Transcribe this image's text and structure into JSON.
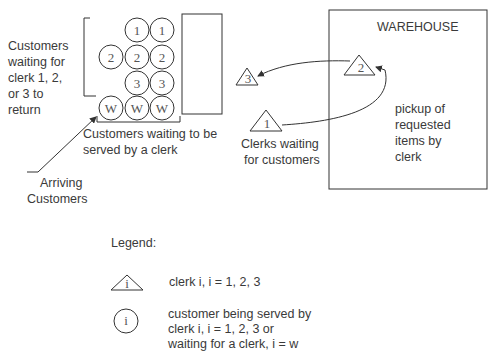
{
  "diagram": {
    "left_label": [
      "Customers",
      "waiting for",
      "clerk 1, 2,",
      "or 3 to",
      "return"
    ],
    "queue_label": [
      "Customers waiting to be",
      "served by a clerk"
    ],
    "arriving_label": [
      "Arriving",
      "Customers"
    ],
    "clerks_waiting_label": [
      "Clerks waiting",
      "for customers"
    ],
    "warehouse_title": "WAREHOUSE",
    "pickup_label": [
      "pickup of",
      "requested",
      "items by",
      "clerk"
    ],
    "circles": {
      "row1": [
        "1",
        "1"
      ],
      "row2": [
        "2",
        "2",
        "2"
      ],
      "row3": [
        "3",
        "3"
      ],
      "row4": [
        "W",
        "W",
        "W"
      ]
    },
    "triangles": {
      "t3": "3",
      "t1": "1",
      "t2": "2"
    }
  },
  "legend": {
    "title": "Legend:",
    "triangle_symbol": "i",
    "triangle_text": "clerk i, i = 1, 2, 3",
    "circle_symbol": "i",
    "circle_text": [
      "customer being served by",
      "clerk i, i = 1, 2, 3 or",
      "waiting for a clerk, i = w"
    ]
  }
}
